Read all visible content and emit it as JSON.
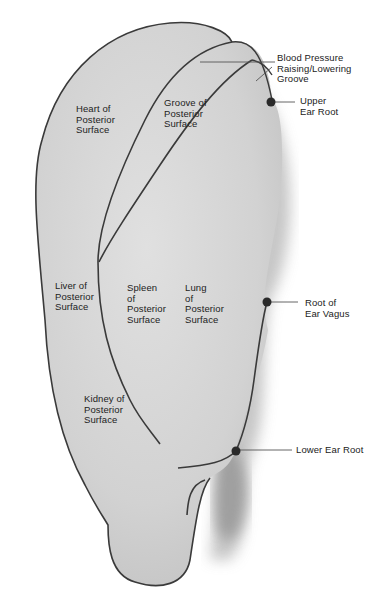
{
  "diagram": {
    "type": "anatomical ear diagram (posterior surface auricular points)",
    "colors": {
      "ear_fill": "#d6d6d6",
      "ear_outline": "#3a3a3a",
      "shadow": "#9a9a9a",
      "point": "#2a2a2a",
      "text": "#222222"
    },
    "regions": [
      {
        "id": "heart",
        "label": "Heart of\nPosterior\nSurface"
      },
      {
        "id": "groove",
        "label": "Groove of\nPosterior\nSurface"
      },
      {
        "id": "liver",
        "label": "Liver of\nPosterior\nSurface"
      },
      {
        "id": "spleen",
        "label": "Spleen\nof\nPosterior\nSurface"
      },
      {
        "id": "lung",
        "label": "Lung\nof\nPosterior\nSurface"
      },
      {
        "id": "kidney",
        "label": "Kidney of\nPosterior\nSurface"
      }
    ],
    "callouts": [
      {
        "id": "bp-groove",
        "label": "Blood Pressure\nRaising/Lowering\nGroove"
      },
      {
        "id": "upper-ear-root",
        "label": "Upper\nEar Root"
      },
      {
        "id": "root-ear-vagus",
        "label": "Root of\nEar Vagus"
      },
      {
        "id": "lower-ear-root",
        "label": "Lower Ear Root"
      }
    ]
  }
}
